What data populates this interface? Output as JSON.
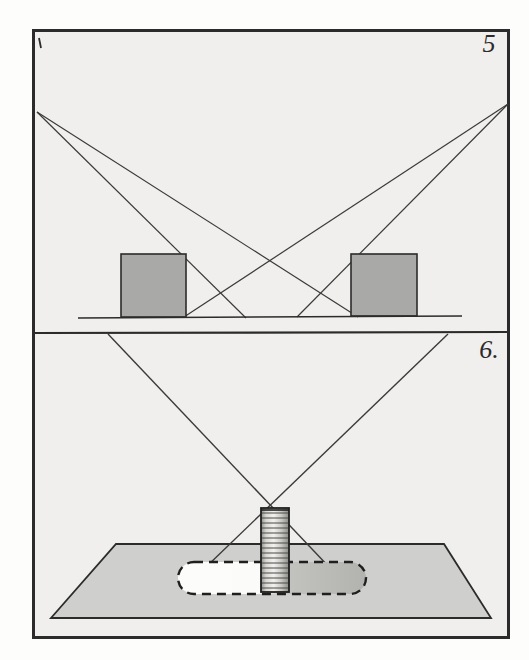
{
  "plate": {
    "title": "Engraved optical plate with two figures",
    "background_color": "#f2f2f0",
    "ink_color": "#2b2b2b",
    "paper_tone": "#efeeec"
  },
  "frame": {
    "name": "outer-border",
    "x": 33,
    "y": 30,
    "width": 476,
    "height": 608,
    "divider_y": 333
  },
  "figures": [
    {
      "id": "figure-5",
      "label": "5",
      "label_x": 489,
      "label_y": 52,
      "caption_note": "Two light sources casting crossing rays past two upright blocks onto a ground line",
      "ground_line": {
        "x1": 78,
        "y1": 318,
        "x2": 462,
        "y2": 316
      },
      "sources": [
        {
          "name": "left-light-source",
          "x": 37,
          "y": 112
        },
        {
          "name": "right-light-source",
          "x": 508,
          "y": 104
        }
      ],
      "blocks": [
        {
          "name": "left-block",
          "x": 121,
          "y": 254,
          "width": 65,
          "height": 63,
          "fill": "#a9a9a7"
        },
        {
          "name": "right-block",
          "x": 351,
          "y": 254,
          "width": 66,
          "height": 62,
          "fill": "#a9a9a7"
        }
      ],
      "rays": [
        {
          "name": "ray-left-outer",
          "x1": 37,
          "y1": 112,
          "x2": 246,
          "y2": 318
        },
        {
          "name": "ray-left-inner",
          "x1": 37,
          "y1": 112,
          "x2": 358,
          "y2": 317
        },
        {
          "name": "ray-right-outer",
          "x1": 508,
          "y1": 104,
          "x2": 297,
          "y2": 317
        },
        {
          "name": "ray-right-inner",
          "x1": 508,
          "y1": 104,
          "x2": 184,
          "y2": 317
        }
      ],
      "crossings": [
        {
          "name": "crossing-center",
          "x": 272,
          "y": 262
        },
        {
          "name": "crossing-left",
          "x": 213,
          "y": 290
        },
        {
          "name": "crossing-right",
          "x": 330,
          "y": 288
        }
      ]
    },
    {
      "id": "figure-6",
      "label": "6.",
      "label_x": 489,
      "label_y": 358,
      "caption_note": "Graduated cylinder standing on a horizontal plane with crossing rays and a dashed oval shadow",
      "plane": {
        "name": "ground-plane",
        "points": "116,544 444,544 491,618 51,618",
        "fill": "#cfcfcd"
      },
      "rays": [
        {
          "name": "ray-from-top-left",
          "x1": 108,
          "y1": 334,
          "x2": 330,
          "y2": 568
        },
        {
          "name": "ray-from-top-right",
          "x1": 448,
          "y1": 334,
          "x2": 205,
          "y2": 568
        }
      ],
      "crossing": {
        "name": "ray-crossing-point",
        "x": 272,
        "y": 492
      },
      "cylinder": {
        "name": "graduated-cylinder",
        "x": 261,
        "y": 508,
        "width": 28,
        "height": 84,
        "graduation_count": 17,
        "fill": "#e6e5e3"
      },
      "shadow_oval": {
        "name": "dashed-shadow-oval",
        "x": 178,
        "y": 562,
        "width": 188,
        "height": 32,
        "light_fill": "#fbfbfa",
        "dark_fill": "#b6b6b3",
        "stroke_style": "dashed"
      }
    }
  ],
  "marks": {
    "corner_tick": {
      "name": "corner-tick-mark",
      "x": 39,
      "y": 40
    }
  }
}
